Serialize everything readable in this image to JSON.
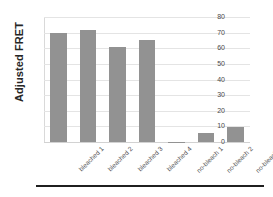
{
  "chart_data": {
    "type": "bar",
    "title": "",
    "xlabel": "",
    "ylabel": "Adjusted FRET",
    "categories": [
      "bleached 1",
      "bleached 2",
      "bleached 3",
      "bleached 4",
      "no-bleach 1",
      "no-bleach 2",
      "no-bleach 3"
    ],
    "values": [
      70,
      71.5,
      61,
      65.5,
      0.3,
      5.5,
      9.5
    ],
    "ylim": [
      0,
      80
    ],
    "yticks": [
      0,
      10,
      20,
      30,
      40,
      50,
      60,
      70,
      80
    ],
    "ytick_labels": [
      "0",
      "10",
      "20",
      "30",
      "40",
      "50",
      "60",
      "70",
      "80"
    ],
    "grid": true,
    "legend": false,
    "bar_color": "#929292",
    "gridline_color": "#e4e4e4",
    "axis_color": "#d9d9d9",
    "text_color": "#4a4a4a",
    "title_color": "#262626"
  }
}
